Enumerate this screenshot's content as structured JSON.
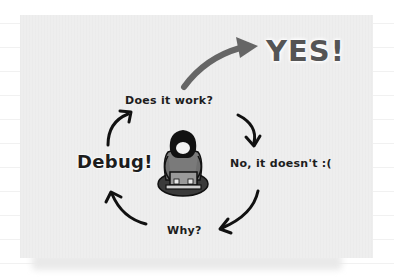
{
  "diagram": {
    "type": "cycle",
    "nodes": [
      {
        "id": "does_it_work",
        "label": "Does it work?"
      },
      {
        "id": "no",
        "label": "No, it doesn't :("
      },
      {
        "id": "why",
        "label": "Why?"
      },
      {
        "id": "debug",
        "label": "Debug!"
      },
      {
        "id": "yes",
        "label": "YES!"
      }
    ],
    "edges": [
      {
        "from": "does_it_work",
        "to": "no"
      },
      {
        "from": "no",
        "to": "why"
      },
      {
        "from": "why",
        "to": "debug"
      },
      {
        "from": "debug",
        "to": "does_it_work"
      },
      {
        "from": "does_it_work",
        "to": "yes"
      }
    ],
    "center_figure": "person-with-laptop"
  },
  "colors": {
    "card": "#eeeeee",
    "ink": "#1d1d1d",
    "yes": "#555555",
    "figure_shirt": "#7a7a7a",
    "figure_hair": "#111111"
  }
}
